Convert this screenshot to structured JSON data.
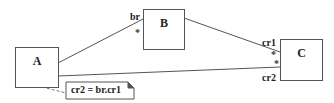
{
  "diagram": {
    "type": "uml-class-diagram",
    "classes": [
      {
        "id": "A",
        "label": "A"
      },
      {
        "id": "B",
        "label": "B"
      },
      {
        "id": "C",
        "label": "C"
      }
    ],
    "associations": [
      {
        "from": "A",
        "to": "B",
        "role_at_B": "br",
        "multiplicity_at_B": "*"
      },
      {
        "from": "B",
        "to": "C",
        "role_at_C": "cr1",
        "multiplicity_at_C": "*"
      },
      {
        "from": "A",
        "to": "C",
        "role_at_C": "cr2",
        "multiplicity_at_C": "*"
      }
    ],
    "note": {
      "text": "cr2 = br.cr1",
      "attached_to": "A"
    },
    "colors": {
      "line": "#555555",
      "text": "#222222",
      "background": "#ffffff"
    }
  }
}
